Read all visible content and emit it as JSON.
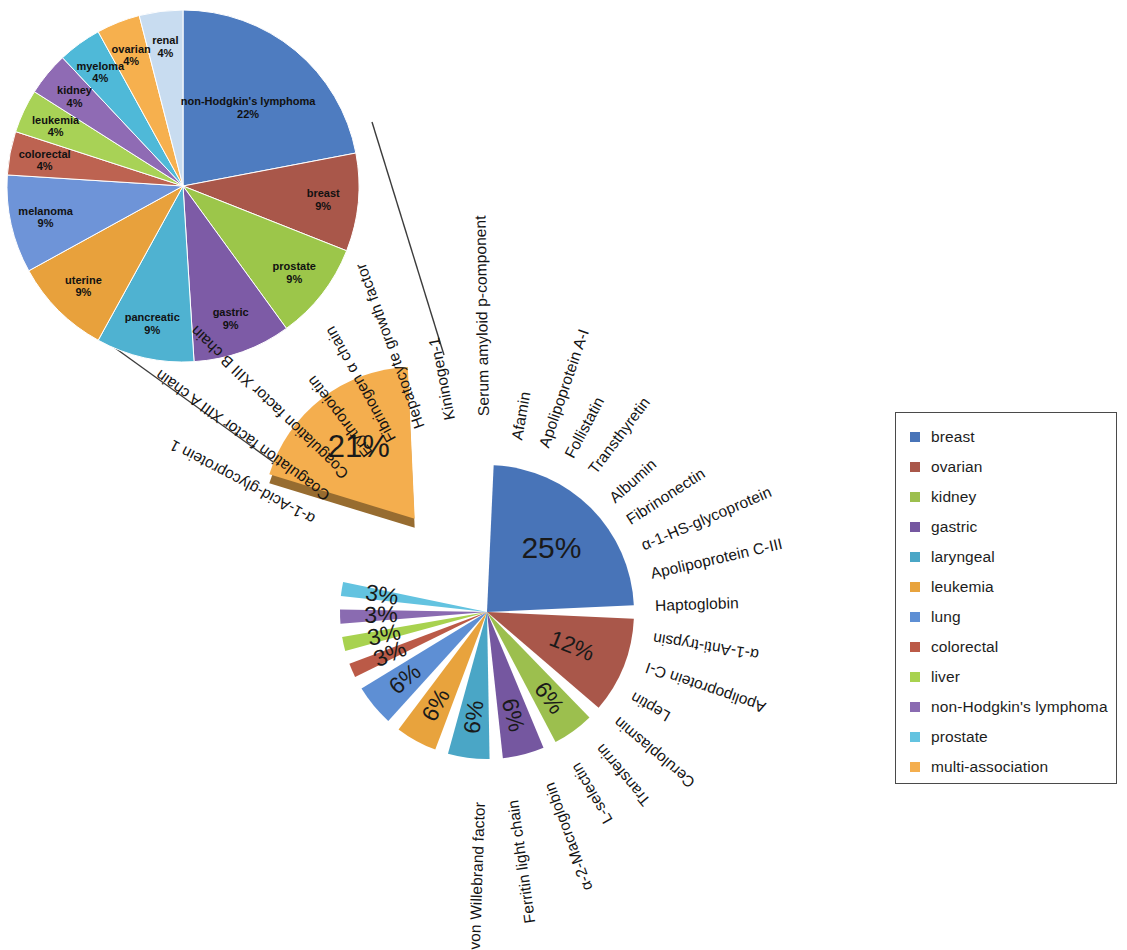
{
  "figure": {
    "title": "",
    "inset_caption": "",
    "legend": {
      "items": [
        {
          "label": "breast",
          "color": "#4874b8"
        },
        {
          "label": "ovarian",
          "color": "#a9574a"
        },
        {
          "label": "kidney",
          "color": "#9cbf4e"
        },
        {
          "label": "gastric",
          "color": "#7557a0"
        },
        {
          "label": "laryngeal",
          "color": "#4aa6c6"
        },
        {
          "label": "leukemia",
          "color": "#e8a33d"
        },
        {
          "label": "lung",
          "color": "#5e8fd4"
        },
        {
          "label": "colorectal",
          "color": "#bb5a47"
        },
        {
          "label": "liver",
          "color": "#a8d24f"
        },
        {
          "label": "non-Hodgkin's lymphoma",
          "color": "#8a6bb1"
        },
        {
          "label": "prostate",
          "color": "#63c3e0"
        },
        {
          "label": "multi-association",
          "color": "#f4ae4e"
        }
      ]
    }
  },
  "chart_data": [
    {
      "id": "main-pie",
      "type": "pie",
      "title": "",
      "legend_position": "right",
      "exploded_slice": "multi-association",
      "slices": [
        {
          "label": "multi-association",
          "percent": 21,
          "percent_text": "21%",
          "color": "#f4ae4e",
          "proteins": [
            "α-1-Acid-glycoprotein 1",
            "Coagulation factor XIII A chain",
            "Coagulation factor XIII B chain",
            "Erythropoietin",
            "Fibrinogen α chain",
            "Hepatocyte growth factor",
            "Kininogen-1"
          ]
        },
        {
          "label": "breast",
          "percent": 25,
          "percent_text": "25%",
          "color": "#4874b8",
          "proteins": [
            "α-1-Acid-glycoprotein 1",
            "Coagulation factor XIII A chain",
            "Coagulation factor XIII B chain",
            "Erythropoietin",
            "Fibrinogen α chain",
            "Hepatocyte growth factor",
            "Kininogen-1",
            "Serum amyloid p-component"
          ]
        },
        {
          "label": "ovarian",
          "percent": 12,
          "percent_text": "12%",
          "color": "#a9574a",
          "proteins": [
            "Afamin",
            "Apolipoprotein A-I",
            "Follistatin",
            "Transthyretin"
          ]
        },
        {
          "label": "kidney",
          "percent": 6,
          "percent_text": "6%",
          "color": "#9cbf4e",
          "proteins": [
            "Albumin",
            "Fibrinonectin"
          ]
        },
        {
          "label": "gastric",
          "percent": 6,
          "percent_text": "6%",
          "color": "#7557a0",
          "proteins": [
            "α-1-HS-glycoprotein",
            "Apolipoprotein C-III"
          ]
        },
        {
          "label": "laryngeal",
          "percent": 6,
          "percent_text": "6%",
          "color": "#4aa6c6",
          "proteins": [
            "Haptoglobin"
          ]
        },
        {
          "label": "leukemia",
          "percent": 6,
          "percent_text": "6%",
          "color": "#e8a33d",
          "proteins": [
            "α-1-Anti-trypsin",
            "Apolipoprotein C-I"
          ]
        },
        {
          "label": "lung",
          "percent": 6,
          "percent_text": "6%",
          "color": "#5e8fd4",
          "proteins": [
            "Ceruloplasmin",
            "Leptin"
          ]
        },
        {
          "label": "colorectal",
          "percent": 3,
          "percent_text": "3%",
          "color": "#bb5a47",
          "proteins": [
            "L-selectin",
            "Transferrin"
          ]
        },
        {
          "label": "liver",
          "percent": 3,
          "percent_text": "3%",
          "color": "#a8d24f",
          "proteins": [
            "α-2-Macroglobin"
          ]
        },
        {
          "label": "non-Hodgkin's lymphoma",
          "percent": 3,
          "percent_text": "3%",
          "color": "#8a6bb1",
          "proteins": [
            "Ferritin light chain"
          ]
        },
        {
          "label": "prostate",
          "percent": 3,
          "percent_text": "3%",
          "color": "#63c3e0",
          "proteins": [
            "von Willebrand factor"
          ]
        }
      ],
      "protein_labels": [
        "α-1-Acid-glycoprotein 1",
        "Coagulation factor XIII  A chain",
        "Coagulation factor XIII  B chain",
        "Erythropoietin",
        "Fibrinogen α chain",
        "Hepatocyte growth factor",
        "Kininogen-1",
        "Serum amyloid p-component",
        "Afamin",
        "Apolipoprotein A-I",
        "Follistatin",
        "Transthyretin",
        "Albumin",
        "Fibrinonectin",
        "α-1-HS-glycoprotein",
        "Apolipoprotein C-III",
        "Haptoglobin",
        "α-1-Anti-trypsin",
        "Apolipoprotein C-I",
        "Leptin",
        "Ceruloplasmin",
        "Transferrin",
        "L-selectin",
        "α-2-Macroglobin",
        "Ferritin light chain",
        "von Willebrand factor"
      ]
    },
    {
      "id": "inset-pie",
      "type": "pie",
      "title": "",
      "description": "breakdown of the multi-association slice",
      "slices": [
        {
          "label": "non-Hodgkin's lymphoma",
          "percent": 22,
          "percent_text": "22%",
          "color": "#4e7cc0"
        },
        {
          "label": "breast",
          "percent": 9,
          "percent_text": "9%",
          "color": "#a9574a"
        },
        {
          "label": "prostate",
          "percent": 9,
          "percent_text": "9%",
          "color": "#9cc64a"
        },
        {
          "label": "gastric",
          "percent": 9,
          "percent_text": "9%",
          "color": "#7d5ba6"
        },
        {
          "label": "pancreatic",
          "percent": 9,
          "percent_text": "9%",
          "color": "#4fb2d1"
        },
        {
          "label": "uterine",
          "percent": 9,
          "percent_text": "9%",
          "color": "#e8a13c"
        },
        {
          "label": "melanoma",
          "percent": 9,
          "percent_text": "9%",
          "color": "#6e94d8"
        },
        {
          "label": "colorectal",
          "percent": 4,
          "percent_text": "4%",
          "color": "#bd6351"
        },
        {
          "label": "leukemia",
          "percent": 4,
          "percent_text": "4%",
          "color": "#a8d256"
        },
        {
          "label": "kidney",
          "percent": 4,
          "percent_text": "4%",
          "color": "#8f6bb4"
        },
        {
          "label": "myeloma",
          "percent": 4,
          "percent_text": "4%",
          "color": "#4fb9d8"
        },
        {
          "label": "ovarian",
          "percent": 4,
          "percent_text": "4%",
          "color": "#f6b04e"
        },
        {
          "label": "renal",
          "percent": 4,
          "percent_text": "4%",
          "color": "#c8dcf0"
        }
      ]
    }
  ]
}
